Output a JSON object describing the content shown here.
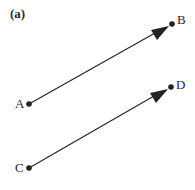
{
  "figure": {
    "panel_label": "(a)",
    "colors": {
      "ink": "#222222",
      "label": "#2a2a2a",
      "background": "#ffffff"
    },
    "points": [
      {
        "id": "A",
        "label": "A",
        "x": 29,
        "y": 104
      },
      {
        "id": "B",
        "label": "B",
        "x": 172,
        "y": 24
      },
      {
        "id": "C",
        "label": "C",
        "x": 29,
        "y": 168
      },
      {
        "id": "D",
        "label": "D",
        "x": 171,
        "y": 87
      }
    ],
    "vectors": [
      {
        "from": "A",
        "to": "B"
      },
      {
        "from": "C",
        "to": "D"
      }
    ]
  }
}
